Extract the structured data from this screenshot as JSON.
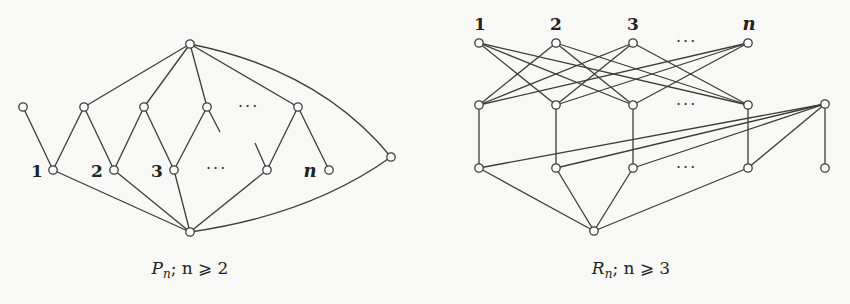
{
  "colors": {
    "background": "#f8f8f6",
    "stroke": "#3c3c3c",
    "node_fill": "#ffffff"
  },
  "diagrams": [
    {
      "id": "P",
      "caption": {
        "symbol": "P",
        "subscript": "n",
        "condition": "; n ⩾ 2"
      },
      "caption_x": 190,
      "labels": [
        {
          "text": "1",
          "x": 37,
          "y": 177,
          "italic": false
        },
        {
          "text": "2",
          "x": 97,
          "y": 177,
          "italic": false
        },
        {
          "text": "3",
          "x": 157,
          "y": 177,
          "italic": false
        },
        {
          "text": "n",
          "x": 310,
          "y": 177,
          "italic": true
        }
      ],
      "ellipses": [
        {
          "text": "···",
          "x": 238,
          "y": 112
        },
        {
          "text": "···",
          "x": 206,
          "y": 174
        }
      ],
      "nodes": [
        {
          "id": "top",
          "x": 190,
          "y": 44
        },
        {
          "id": "m0",
          "x": 23,
          "y": 107
        },
        {
          "id": "m1",
          "x": 84,
          "y": 107
        },
        {
          "id": "m2",
          "x": 144,
          "y": 107
        },
        {
          "id": "m3",
          "x": 207,
          "y": 107
        },
        {
          "id": "mk",
          "x": 298,
          "y": 107
        },
        {
          "id": "b1",
          "x": 53,
          "y": 170
        },
        {
          "id": "b2",
          "x": 114,
          "y": 170
        },
        {
          "id": "b3",
          "x": 174,
          "y": 170
        },
        {
          "id": "bk",
          "x": 267,
          "y": 170
        },
        {
          "id": "bn",
          "x": 329,
          "y": 170
        },
        {
          "id": "right",
          "x": 391,
          "y": 157
        },
        {
          "id": "bottom",
          "x": 190,
          "y": 232
        }
      ],
      "edges": [
        [
          "top",
          "m1"
        ],
        [
          "top",
          "m2"
        ],
        [
          "top",
          "m3"
        ],
        [
          "top",
          "mk"
        ],
        [
          "m0",
          "b1"
        ],
        [
          "m1",
          "b1"
        ],
        [
          "m1",
          "b2"
        ],
        [
          "m2",
          "b2"
        ],
        [
          "m2",
          "b3"
        ],
        [
          "m3",
          "b3"
        ],
        [
          "mk",
          "bk"
        ],
        [
          "mk",
          "bn"
        ],
        [
          "b1",
          "bottom"
        ],
        [
          "b2",
          "bottom"
        ],
        [
          "b3",
          "bottom"
        ],
        [
          "bk",
          "bottom"
        ]
      ],
      "stubs": [
        {
          "x1": 207,
          "y1": 107,
          "x2": 220,
          "y2": 132
        },
        {
          "x1": 255,
          "y1": 143,
          "x2": 267,
          "y2": 170
        }
      ],
      "arcs": [
        {
          "from": "top",
          "to": "right",
          "cx": 320,
          "cy": 70
        },
        {
          "from": "bottom",
          "to": "right",
          "cx": 310,
          "cy": 215
        }
      ]
    },
    {
      "id": "R",
      "caption": {
        "symbol": "R",
        "subscript": "n",
        "condition": "; n ⩾ 3"
      },
      "caption_x": 631,
      "labels": [
        {
          "text": "1",
          "x": 480,
          "y": 30,
          "italic": false
        },
        {
          "text": "2",
          "x": 556,
          "y": 30,
          "italic": false
        },
        {
          "text": "3",
          "x": 633,
          "y": 30,
          "italic": false
        },
        {
          "text": "n",
          "x": 749,
          "y": 30,
          "italic": true
        }
      ],
      "ellipses": [
        {
          "text": "···",
          "x": 676,
          "y": 47
        },
        {
          "text": "···",
          "x": 676,
          "y": 110
        },
        {
          "text": "···",
          "x": 676,
          "y": 173
        }
      ],
      "nodes": [
        {
          "id": "t1",
          "x": 479,
          "y": 43
        },
        {
          "id": "t2",
          "x": 556,
          "y": 43
        },
        {
          "id": "t3",
          "x": 633,
          "y": 43
        },
        {
          "id": "tn",
          "x": 748,
          "y": 43
        },
        {
          "id": "m1",
          "x": 479,
          "y": 105
        },
        {
          "id": "m2",
          "x": 556,
          "y": 105
        },
        {
          "id": "m3",
          "x": 633,
          "y": 105
        },
        {
          "id": "mn",
          "x": 748,
          "y": 105
        },
        {
          "id": "r",
          "x": 825,
          "y": 104
        },
        {
          "id": "b1",
          "x": 479,
          "y": 168
        },
        {
          "id": "b2",
          "x": 556,
          "y": 168
        },
        {
          "id": "b3",
          "x": 633,
          "y": 168
        },
        {
          "id": "bn",
          "x": 748,
          "y": 168
        },
        {
          "id": "rb",
          "x": 825,
          "y": 168
        },
        {
          "id": "bottom",
          "x": 594,
          "y": 231
        }
      ],
      "edges": [
        [
          "t1",
          "m2"
        ],
        [
          "t1",
          "m3"
        ],
        [
          "t1",
          "mn"
        ],
        [
          "t2",
          "m1"
        ],
        [
          "t2",
          "m3"
        ],
        [
          "t2",
          "mn"
        ],
        [
          "t3",
          "m1"
        ],
        [
          "t3",
          "m2"
        ],
        [
          "t3",
          "mn"
        ],
        [
          "tn",
          "m1"
        ],
        [
          "tn",
          "m2"
        ],
        [
          "tn",
          "m3"
        ],
        [
          "m1",
          "b1"
        ],
        [
          "m2",
          "b2"
        ],
        [
          "m3",
          "b3"
        ],
        [
          "mn",
          "bn"
        ],
        [
          "r",
          "b1"
        ],
        [
          "r",
          "b2"
        ],
        [
          "r",
          "b3"
        ],
        [
          "r",
          "bn"
        ],
        [
          "r",
          "rb"
        ],
        [
          "b1",
          "bottom"
        ],
        [
          "b2",
          "bottom"
        ],
        [
          "b3",
          "bottom"
        ],
        [
          "bn",
          "bottom"
        ]
      ],
      "stubs": [],
      "arcs": []
    }
  ]
}
